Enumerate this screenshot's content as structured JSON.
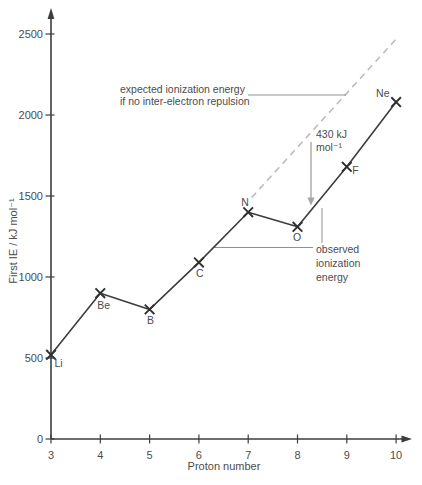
{
  "chart_data": {
    "type": "line",
    "xlabel": "Proton number",
    "ylabel": "First IE / kJ mol⁻¹",
    "xlim": [
      3,
      10
    ],
    "ylim": [
      0,
      2500
    ],
    "xticks": [
      3,
      4,
      5,
      6,
      7,
      8,
      9,
      10
    ],
    "yticks": [
      0,
      500,
      1000,
      1500,
      2000,
      2500
    ],
    "grid": false,
    "legend": "none",
    "series": [
      {
        "name": "observed first ionization energy",
        "style": "solid",
        "marker": "x",
        "x": [
          3,
          4,
          5,
          6,
          7,
          8,
          9,
          10
        ],
        "values": [
          520,
          900,
          800,
          1090,
          1400,
          1310,
          1680,
          2080
        ],
        "point_labels": [
          "Li",
          "Be",
          "B",
          "C",
          "N",
          "O",
          "F",
          "Ne"
        ]
      },
      {
        "name": "expected ionization energy if no inter-electron repulsion",
        "style": "dashed",
        "marker": "none",
        "x": [
          7.07,
          10.02
        ],
        "values": [
          1490,
          2475
        ],
        "point_labels": []
      }
    ]
  },
  "annotations": {
    "expected": {
      "lines": [
        "expected ionization energy",
        "if no inter-electron repulsion"
      ]
    },
    "difference": {
      "lines": [
        "430 kJ",
        "mol⁻¹"
      ]
    },
    "observed": {
      "lines": [
        "observed",
        "ionization",
        "energy"
      ]
    }
  },
  "colors": {
    "axis": "#3d3d3d",
    "observed_line": "#3d3d3d",
    "marker": "#2f2f2f",
    "expected_dashed": "#bcbcbc",
    "arrow": "#a6a6a6",
    "leader": "#919191",
    "text": "#4c4c4c"
  }
}
